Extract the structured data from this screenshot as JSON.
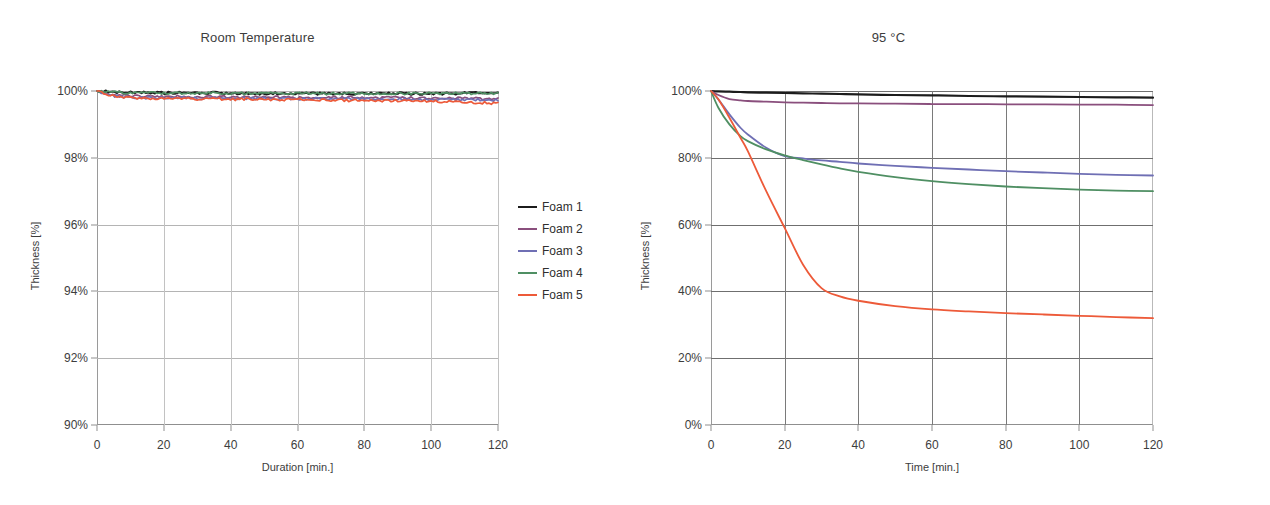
{
  "charts": [
    {
      "id": "room-temperature",
      "title": "Room Temperature",
      "xlabel": "Duration [min.]",
      "ylabel": "Thickness [%]",
      "xticks": [
        "0",
        "20",
        "40",
        "60",
        "80",
        "100",
        "120"
      ],
      "yticks": [
        "100%",
        "98%",
        "96%",
        "94%",
        "92%",
        "90%"
      ],
      "legend": [
        {
          "label": "Foam 1",
          "color": "#1c1c1c"
        },
        {
          "label": "Foam 2",
          "color": "#8a4f7d"
        },
        {
          "label": "Foam 3",
          "color": "#6f6fb4"
        },
        {
          "label": "Foam 4",
          "color": "#4f8f63"
        },
        {
          "label": "Foam 5",
          "color": "#ed5a39"
        }
      ]
    },
    {
      "id": "ninety-five-c",
      "title": "95 °C",
      "xlabel": "Time [min.]",
      "ylabel": "Thickness [%]",
      "xticks": [
        "0",
        "20",
        "40",
        "60",
        "80",
        "100",
        "120"
      ],
      "yticks": [
        "100%",
        "80%",
        "60%",
        "40%",
        "20%",
        "0%"
      ],
      "legend": [
        {
          "label": "Foam 1",
          "color": "#1c1c1c"
        },
        {
          "label": "Foam 2",
          "color": "#8a4f7d"
        },
        {
          "label": "Foam 3",
          "color": "#6f6fb4"
        },
        {
          "label": "Foam 4",
          "color": "#4f8f63"
        },
        {
          "label": "Foam 5",
          "color": "#ed5a39"
        }
      ]
    }
  ],
  "chart_data": [
    {
      "type": "line",
      "title": "Room Temperature",
      "xlabel": "Duration [min.]",
      "ylabel": "Thickness [%]",
      "xlim": [
        0,
        120
      ],
      "ylim": [
        90,
        100
      ],
      "xticks": [
        0,
        20,
        40,
        60,
        80,
        100,
        120
      ],
      "yticks": [
        90,
        92,
        94,
        96,
        98,
        100
      ],
      "grid": true,
      "legend_position": "right",
      "x": [
        0,
        5,
        10,
        15,
        20,
        25,
        30,
        35,
        40,
        45,
        50,
        55,
        60,
        65,
        70,
        75,
        80,
        85,
        90,
        95,
        100,
        105,
        110,
        115,
        120
      ],
      "series": [
        {
          "name": "Foam 1",
          "color": "#1c1c1c",
          "values": [
            100,
            99.97,
            99.95,
            99.96,
            99.94,
            99.95,
            99.93,
            99.94,
            99.92,
            99.93,
            99.92,
            99.93,
            99.91,
            99.92,
            99.92,
            99.93,
            99.91,
            99.92,
            99.93,
            99.92,
            99.93,
            99.92,
            99.93,
            99.94,
            99.93
          ]
        },
        {
          "name": "Foam 2",
          "color": "#8a4f7d",
          "values": [
            100,
            99.88,
            99.85,
            99.84,
            99.83,
            99.84,
            99.82,
            99.83,
            99.82,
            99.81,
            99.82,
            99.81,
            99.8,
            99.81,
            99.8,
            99.81,
            99.8,
            99.79,
            99.8,
            99.79,
            99.78,
            99.79,
            99.78,
            99.77,
            99.76
          ]
        },
        {
          "name": "Foam 3",
          "color": "#6f6fb4",
          "values": [
            100,
            99.85,
            99.82,
            99.8,
            99.79,
            99.8,
            99.78,
            99.79,
            99.78,
            99.77,
            99.78,
            99.77,
            99.76,
            99.77,
            99.76,
            99.77,
            99.76,
            99.75,
            99.76,
            99.75,
            99.74,
            99.75,
            99.74,
            99.73,
            99.72
          ]
        },
        {
          "name": "Foam 4",
          "color": "#4f8f63",
          "values": [
            100,
            99.96,
            99.94,
            99.95,
            99.93,
            99.94,
            99.93,
            99.94,
            99.92,
            99.93,
            99.92,
            99.93,
            99.92,
            99.93,
            99.92,
            99.93,
            99.92,
            99.93,
            99.92,
            99.93,
            99.92,
            99.93,
            99.92,
            99.93,
            99.92
          ]
        },
        {
          "name": "Foam 5",
          "color": "#ed5a39",
          "values": [
            100,
            99.84,
            99.8,
            99.78,
            99.77,
            99.78,
            99.76,
            99.77,
            99.75,
            99.76,
            99.75,
            99.74,
            99.74,
            99.73,
            99.73,
            99.72,
            99.72,
            99.71,
            99.71,
            99.7,
            99.69,
            99.68,
            99.67,
            99.65,
            99.63
          ]
        }
      ]
    },
    {
      "type": "line",
      "title": "95 °C",
      "xlabel": "Time [min.]",
      "ylabel": "Thickness [%]",
      "xlim": [
        0,
        120
      ],
      "ylim": [
        0,
        100
      ],
      "xticks": [
        0,
        20,
        40,
        60,
        80,
        100,
        120
      ],
      "yticks": [
        0,
        20,
        40,
        60,
        80,
        100
      ],
      "grid": true,
      "legend_position": "right",
      "x": [
        0,
        2,
        5,
        8,
        10,
        15,
        20,
        25,
        30,
        35,
        40,
        50,
        60,
        70,
        80,
        90,
        100,
        110,
        120
      ],
      "series": [
        {
          "name": "Foam 1",
          "color": "#1c1c1c",
          "values": [
            100,
            99.9,
            99.8,
            99.7,
            99.6,
            99.5,
            99.4,
            99.3,
            99.2,
            99.1,
            99.0,
            98.8,
            98.7,
            98.5,
            98.4,
            98.3,
            98.2,
            98.1,
            98.0
          ]
        },
        {
          "name": "Foam 2",
          "color": "#8a4f7d",
          "values": [
            100,
            98.8,
            97.6,
            97.2,
            97.0,
            96.8,
            96.6,
            96.5,
            96.4,
            96.3,
            96.3,
            96.2,
            96.1,
            96.1,
            96.0,
            96.0,
            95.9,
            95.9,
            95.8
          ]
        },
        {
          "name": "Foam 3",
          "color": "#6f6fb4",
          "values": [
            100,
            97.5,
            93.0,
            89.0,
            87.0,
            83.0,
            80.5,
            79.8,
            79.2,
            78.8,
            78.3,
            77.6,
            77.0,
            76.5,
            76.0,
            75.6,
            75.2,
            74.9,
            74.7
          ]
        },
        {
          "name": "Foam 4",
          "color": "#4f8f63",
          "values": [
            100,
            95.0,
            90.0,
            86.5,
            85.0,
            82.5,
            80.7,
            79.3,
            78.0,
            76.8,
            75.8,
            74.2,
            73.0,
            72.1,
            71.4,
            70.9,
            70.5,
            70.2,
            70.0
          ]
        },
        {
          "name": "Foam 5",
          "color": "#ed5a39",
          "values": [
            100,
            97.5,
            92.0,
            86.0,
            82.0,
            70.0,
            59.0,
            48.0,
            41.0,
            38.5,
            37.2,
            35.6,
            34.6,
            34.0,
            33.5,
            33.1,
            32.7,
            32.3,
            32.0
          ]
        }
      ]
    }
  ]
}
